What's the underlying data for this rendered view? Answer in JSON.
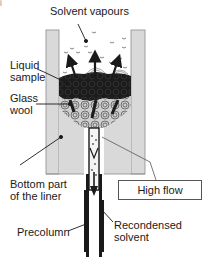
{
  "diagram": {
    "corner_mark": "j",
    "labels": {
      "solvent_vapours": "Solvent vapours",
      "liquid_sample_line1": "Liquid",
      "liquid_sample_line2": "sample",
      "glass_wool_line1": "Glass",
      "glass_wool_line2": "wool",
      "bottom_liner_line1": "Bottom part",
      "bottom_liner_line2": "of the liner",
      "high_flow": "High flow",
      "precolumn": "Precolumn",
      "recondensed_line1": "Recondensed",
      "recondensed_line2": "solvent"
    },
    "colors": {
      "liner_wall": "#d9d9d9",
      "liner_wall_edge": "#8c8c8c",
      "liquid": "#1c1c1c",
      "glass_wool": "#bdbdbd",
      "tube": "#1a1a1a",
      "leader": "#1a1a1a"
    }
  }
}
